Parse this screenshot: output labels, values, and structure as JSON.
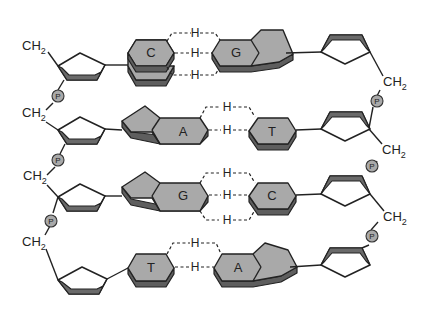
{
  "diagram": {
    "colors": {
      "base_fill": "#a9a9a9",
      "base_shadow": "#5e5e5e",
      "line": "#222222",
      "background": "#ffffff"
    },
    "labels": {
      "ch2": "CH",
      "sub2": "2",
      "phosphate": "P",
      "hydrogen": "H"
    },
    "base_pairs": [
      {
        "left": "C",
        "right": "G",
        "h_bonds": 3
      },
      {
        "left": "A",
        "right": "T",
        "h_bonds": 2
      },
      {
        "left": "G",
        "right": "C",
        "h_bonds": 3
      },
      {
        "left": "T",
        "right": "A",
        "h_bonds": 2
      }
    ],
    "left_backbone": [
      "CH2",
      "P",
      "CH2",
      "P",
      "CH2",
      "P",
      "CH2"
    ],
    "right_backbone": [
      "CH2",
      "P",
      "CH2",
      "P",
      "CH2",
      "P"
    ]
  }
}
